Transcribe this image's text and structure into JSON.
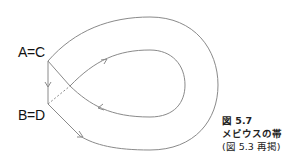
{
  "labels": {
    "top_left": "A=C",
    "bottom_left": "B=D"
  },
  "caption": {
    "figure_number": "図 5.7",
    "title": "メビウスの帯",
    "note": "(図 5.3 再掲)"
  },
  "colors": {
    "line": "#8a8a8a",
    "text": "#111111"
  }
}
